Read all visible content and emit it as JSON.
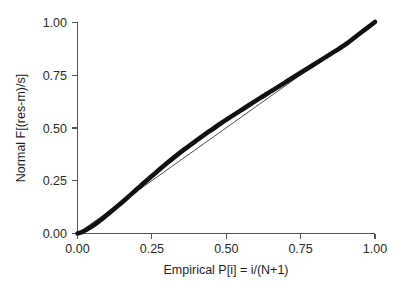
{
  "chart_data": {
    "type": "line",
    "title": "",
    "xlabel": "Empirical P[i] = i/(N+1)",
    "ylabel": "Normal F[(res-m)/s]",
    "xlim": [
      0.0,
      1.0
    ],
    "ylim": [
      0.0,
      1.0
    ],
    "grid": false,
    "legend": false,
    "legend_position": "none",
    "xticks": [
      "0.00",
      "0.25",
      "0.50",
      "0.75",
      "1.00"
    ],
    "yticks": [
      "0.00",
      "0.25",
      "0.50",
      "0.75",
      "1.00"
    ],
    "xtick_values": [
      0.0,
      0.25,
      0.5,
      0.75,
      1.0
    ],
    "ytick_values": [
      0.0,
      0.25,
      0.5,
      0.75,
      1.0
    ],
    "series": [
      {
        "name": "Normal probability curve",
        "style": "thick-black-curve",
        "color": "#111111",
        "x": [
          0.0,
          0.01,
          0.02,
          0.03,
          0.05,
          0.07,
          0.09,
          0.12,
          0.15,
          0.18,
          0.2,
          0.22,
          0.25,
          0.28,
          0.3,
          0.33,
          0.36,
          0.4,
          0.44,
          0.48,
          0.52,
          0.56,
          0.6,
          0.65,
          0.7,
          0.75,
          0.8,
          0.85,
          0.9,
          0.95,
          1.0
        ],
        "y": [
          0.0,
          0.004,
          0.01,
          0.018,
          0.035,
          0.055,
          0.077,
          0.112,
          0.148,
          0.185,
          0.21,
          0.235,
          0.272,
          0.308,
          0.332,
          0.366,
          0.399,
          0.44,
          0.48,
          0.519,
          0.556,
          0.592,
          0.628,
          0.672,
          0.716,
          0.76,
          0.804,
          0.848,
          0.893,
          0.947,
          1.0
        ]
      },
      {
        "name": "Reference diagonal",
        "style": "thin-straight-line",
        "color": "#3a3a3a",
        "x": [
          0.0,
          1.0
        ],
        "y": [
          0.0,
          1.0
        ]
      }
    ]
  },
  "axes": {
    "x_title": "Empirical P[i] = i/(N+1)",
    "y_title": "Normal F[(res-m)/s]"
  }
}
